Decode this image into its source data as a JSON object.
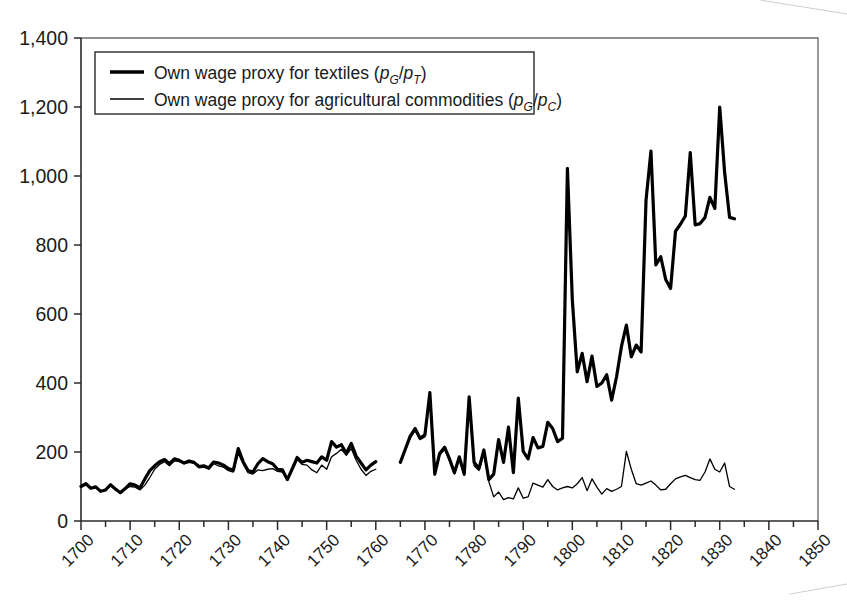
{
  "chart_data": {
    "type": "line",
    "title": "",
    "subtitle": "",
    "xlabel": "",
    "ylabel": "",
    "xlim": [
      1700,
      1850
    ],
    "ylim": [
      0,
      1400
    ],
    "grid": false,
    "legend_position": "top-left",
    "x_ticks": [
      1700,
      1710,
      1720,
      1730,
      1740,
      1750,
      1760,
      1770,
      1780,
      1790,
      1800,
      1810,
      1820,
      1830,
      1840,
      1850
    ],
    "x_tick_labels": [
      "1700",
      "1710",
      "1720",
      "1730",
      "1740",
      "1750",
      "1760",
      "1770",
      "1780",
      "1790",
      "1800",
      "1810",
      "1820",
      "1830",
      "1840",
      "1850"
    ],
    "x_minor_tick_step": 5,
    "y_ticks": [
      0,
      200,
      400,
      600,
      800,
      1000,
      1200,
      1400
    ],
    "y_tick_labels": [
      "0",
      "200",
      "400",
      "600",
      "800",
      "1,000",
      "1,200",
      "1,400"
    ],
    "series": [
      {
        "name": "Own wage proxy for textiles (pG/pT)",
        "legend_text_main": "Own wage proxy for textiles (",
        "legend_var_1": "p",
        "legend_sub_1": "G",
        "legend_slash": "/",
        "legend_var_2": "p",
        "legend_sub_2": "T",
        "legend_close": ")",
        "style": "thick",
        "color": "#000000",
        "linewidth": 3.2,
        "segments": [
          {
            "x_start": 1700,
            "values": [
              100,
              108,
              95,
              99,
              86,
              90,
              105,
              93,
              82,
              94,
              108,
              104,
              96,
              122,
              146,
              160,
              172,
              178,
              166,
              180,
              176,
              168,
              174,
              170,
              158,
              160,
              154,
              171,
              168,
              162,
              152,
              147,
              210,
              172,
              146,
              142,
              166,
              181,
              172,
              166,
              150,
              148,
              120,
              152,
              184,
              170,
              176,
              172,
              168,
              186,
              176,
              230,
              214,
              221,
              196,
              225,
              188,
              168,
              148,
              162,
              172
            ]
          },
          {
            "x_start": 1765,
            "values": [
              170,
              208,
              246,
              268,
              240,
              250,
              372,
              136,
              196,
              214,
              180,
              140,
              186,
              136,
              360,
              170,
              152,
              206,
              120,
              136,
              236,
              170,
              272,
              140,
              356,
              202,
              180,
              242,
              212,
              216,
              286,
              268,
              230,
              240,
              1022,
              640,
              432,
              486,
              404,
              478,
              390,
              400,
              424,
              350,
              418,
              506,
              568,
              476,
              510,
              490,
              930,
              1072,
              742,
              766,
              700,
              674,
              840,
              860,
              884,
              1068,
              858,
              862,
              880,
              938,
              906,
              1200,
              1010,
              880,
              876
            ]
          }
        ]
      },
      {
        "name": "Own wage proxy for agricultural commodities (pG/pC)",
        "legend_text_main": "Own wage proxy for agricultural commodities (",
        "legend_var_1": "p",
        "legend_sub_1": "G",
        "legend_slash": "/",
        "legend_var_2": "p",
        "legend_sub_2": "C",
        "legend_close": ")",
        "style": "thin",
        "color": "#000000",
        "linewidth": 1.3,
        "segments": [
          {
            "x_start": 1700,
            "values": [
              100,
              106,
              94,
              97,
              86,
              89,
              102,
              92,
              82,
              93,
              100,
              98,
              90,
              104,
              126,
              150,
              164,
              172,
              160,
              174,
              172,
              166,
              170,
              168,
              154,
              156,
              150,
              166,
              160,
              156,
              146,
              142,
              196,
              166,
              140,
              136,
              148,
              146,
              150,
              152,
              144,
              142,
              118,
              146,
              178,
              164,
              162,
              148,
              140,
              162,
              150,
              186,
              196,
              208,
              190,
              210,
              176,
              150,
              132,
              144,
              150
            ]
          },
          {
            "x_start": 1765,
            "values": [
              168,
              204,
              240,
              262,
              236,
              244,
              360,
              134,
              190,
              208,
              174,
              136,
              178,
              132,
              348,
              160,
              146,
              196,
              114,
              70,
              84,
              62,
              68,
              64,
              96,
              66,
              70,
              110,
              104,
              98,
              120,
              100,
              90,
              96,
              100,
              96,
              108,
              126,
              88,
              122,
              98,
              78,
              94,
              86,
              92,
              100,
              202,
              150,
              108,
              104,
              110,
              116,
              104,
              90,
              92,
              108,
              122,
              128,
              132,
              126,
              120,
              118,
              142,
              180,
              150,
              142,
              168,
              100,
              92
            ]
          }
        ]
      }
    ]
  },
  "legend": {
    "entries": [
      {
        "label_prefix": "Own wage proxy for textiles (",
        "num": "p",
        "num_sub": "G",
        "slash": "/",
        "den": "p",
        "den_sub": "T",
        "suffix": ")",
        "swatch": "thick-line-swatch"
      },
      {
        "label_prefix": "Own wage proxy for agricultural commodities (",
        "num": "p",
        "num_sub": "G",
        "slash": "/",
        "den": "p",
        "den_sub": "C",
        "suffix": ")",
        "swatch": "thin-line-swatch"
      }
    ]
  }
}
